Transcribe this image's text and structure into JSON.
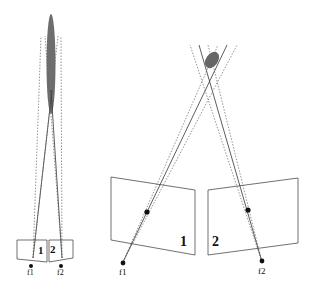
{
  "figure": {
    "left_panel": {
      "description": "Two nearly parallel cameras (short baseline) viewing a point; elongated uncertainty region along depth",
      "labels": {
        "image_plane_1": "1",
        "image_plane_2": "2",
        "focal_1": "f1",
        "focal_2": "f2"
      }
    },
    "right_panel": {
      "description": "Two converging cameras (wide baseline) viewing a point; compact uncertainty region",
      "labels": {
        "image_plane_1": "1",
        "image_plane_2": "2",
        "focal_1": "f1",
        "focal_2": "f2"
      }
    },
    "colors": {
      "line": "#333333",
      "dotted": "#666666",
      "uncertainty": "#555555",
      "background": "#ffffff"
    }
  }
}
